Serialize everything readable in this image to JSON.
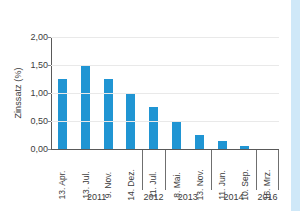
{
  "chart_data": {
    "type": "bar",
    "title": "",
    "subtitle": "",
    "xlabel": "",
    "ylabel": "Zinssatz (%)",
    "ylim": [
      0.0,
      2.0
    ],
    "ytick_labels": [
      "0,00",
      "0,50",
      "1,00",
      "1,50",
      "2,00"
    ],
    "ytick_values": [
      0.0,
      0.5,
      1.0,
      1.5,
      2.0
    ],
    "grid": "horizontal",
    "legend": "none",
    "bar_color": "#2095d3",
    "gridline_color": "#e9e9e9",
    "axis_color": "#595959",
    "categories": [
      "13. Apr.",
      "13. Jul.",
      "9. Nov.",
      "14. Dez.",
      "11. Jul.",
      "8. Mai.",
      "13. Nov.",
      "11. Jun.",
      "10. Sep.",
      "16. Mrz."
    ],
    "values": [
      1.25,
      1.5,
      1.25,
      1.0,
      0.75,
      0.5,
      0.25,
      0.15,
      0.05,
      0.0
    ],
    "group_labels": [
      "2011",
      "2012",
      "2013",
      "2014",
      "2016"
    ],
    "group_sizes": [
      4,
      1,
      2,
      2,
      1
    ]
  }
}
